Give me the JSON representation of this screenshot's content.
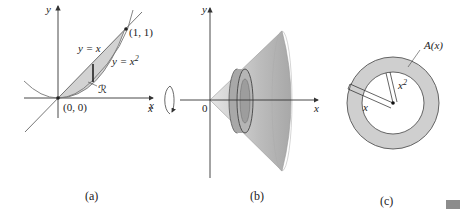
{
  "panels": {
    "a": {
      "caption": "(a)",
      "axis_x": "x",
      "axis_y": "y",
      "curve_line": "y = x",
      "curve_parabola": "y = x",
      "curve_parabola_exp": "2",
      "point_top": "(1, 1)",
      "point_origin": "(0, 0)",
      "region": "ℛ"
    },
    "b": {
      "caption": "(b)",
      "axis_x": "x",
      "axis_y": "y",
      "axis_x_left": "x",
      "origin": "0"
    },
    "c": {
      "caption": "(c)",
      "area_label": "A(x)",
      "outer_radius": "x",
      "inner_radius": "x",
      "inner_radius_exp": "2"
    }
  },
  "colors": {
    "shade": "#d2d2d2",
    "cone": "#bdbdbd",
    "ring": "#cfcfcf",
    "line": "#333333"
  }
}
